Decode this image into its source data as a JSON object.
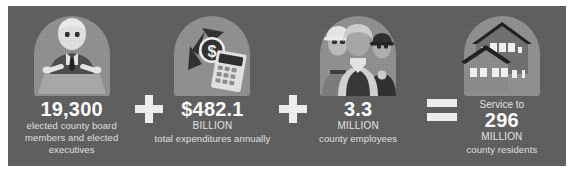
{
  "theme": {
    "panel_bg": "#5d5d5d",
    "arch_bg": "#8f8f8f",
    "operator_color": "#f2f2f2",
    "number_color": "#ffffff",
    "text_color": "#e3e3e3",
    "page_bg": "#ffffff"
  },
  "stats": [
    {
      "icon": "official-at-podium-icon",
      "pre": "",
      "value": "19,300",
      "unit": "",
      "description": "elected county board members and elected executives"
    },
    {
      "icon": "money-calculator-icon",
      "pre": "",
      "value": "$482.1",
      "unit": "BILLION",
      "description": "total expenditures annually"
    },
    {
      "icon": "county-workers-icon",
      "pre": "",
      "value": "3.3",
      "unit": "MILLION",
      "description": "county employees"
    },
    {
      "icon": "houses-icon",
      "pre": "Service to",
      "value": "296",
      "unit": "MILLION",
      "description": "county residents"
    }
  ],
  "operators": [
    {
      "name": "plus-operator",
      "symbol": "+"
    },
    {
      "name": "plus-operator",
      "symbol": "+"
    },
    {
      "name": "equals-operator",
      "symbol": "="
    }
  ]
}
